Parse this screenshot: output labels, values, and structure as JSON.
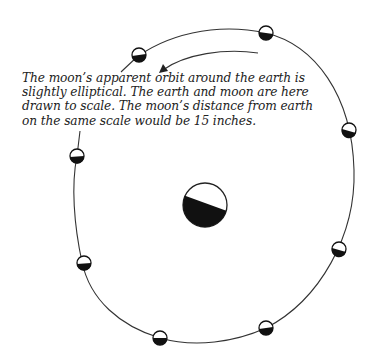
{
  "figure": {
    "caption_lines": [
      "The moon’s apparent orbit around the earth is",
      "slightly elliptical. The earth and moon are here",
      "drawn to scale. The moon’s distance from earth",
      "on the same scale would be 15 inches."
    ],
    "orbit": {
      "cx": 213,
      "cy": 185,
      "rx": 141,
      "ry": 160,
      "color": "#333333"
    },
    "earth": {
      "cx": 205,
      "cy": 205,
      "r": 22,
      "shadow_color": "#111111"
    },
    "moons": [
      {
        "name": "moon-top-left",
        "cx": 139,
        "cy": 55
      },
      {
        "name": "moon-top-right",
        "cx": 266,
        "cy": 33
      },
      {
        "name": "moon-right",
        "cx": 349,
        "cy": 130
      },
      {
        "name": "moon-lower-right",
        "cx": 339,
        "cy": 249
      },
      {
        "name": "moon-bottom-right",
        "cx": 266,
        "cy": 328
      },
      {
        "name": "moon-bottom",
        "cx": 160,
        "cy": 338
      },
      {
        "name": "moon-lower-left",
        "cx": 84,
        "cy": 263
      },
      {
        "name": "moon-left",
        "cx": 77,
        "cy": 156
      }
    ],
    "moon_radius": 7,
    "arrow": {
      "direction": "counter-clockwise",
      "label": "orbit-direction"
    }
  }
}
